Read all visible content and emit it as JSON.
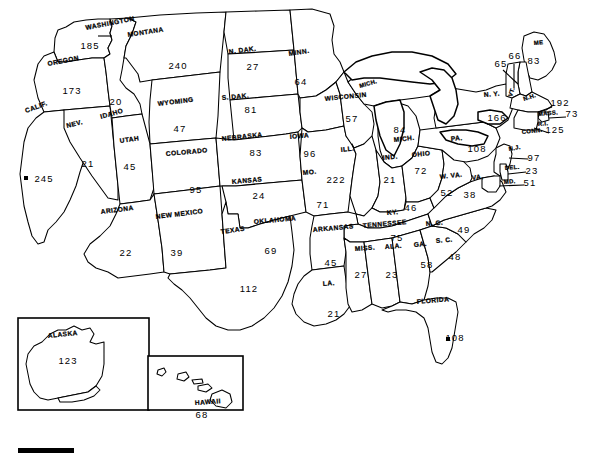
{
  "map": {
    "title": "United States map with per-state values",
    "projection_note": "Lower 48 with Alaska and Hawaii insets",
    "line_color": "#000000",
    "background_color": "#ffffff",
    "scale_bar": {
      "name": "scale-bar",
      "label": ""
    }
  },
  "states": [
    {
      "code": "WA",
      "name": "WASHINGTON",
      "value": "185",
      "nx": 86,
      "ny": 30,
      "rot": -11,
      "vx": 90,
      "vy": 49,
      "size": "normal"
    },
    {
      "code": "OR",
      "name": "OREGON",
      "value": "173",
      "nx": 48,
      "ny": 66,
      "rot": -11,
      "vx": 72,
      "vy": 94,
      "size": "normal"
    },
    {
      "code": "ID",
      "name": "IDAHO",
      "value": "20",
      "nx": 101,
      "ny": 119,
      "rot": -16,
      "vx": 116,
      "vy": 105,
      "size": "normal"
    },
    {
      "code": "MT",
      "name": "MONTANA",
      "value": "240",
      "nx": 128,
      "ny": 37,
      "rot": -9,
      "vx": 178,
      "vy": 69,
      "size": "normal"
    },
    {
      "code": "WY",
      "name": "WYOMING",
      "value": "47",
      "nx": 158,
      "ny": 106,
      "rot": -7,
      "vx": 180,
      "vy": 132,
      "size": "normal"
    },
    {
      "code": "ND",
      "name": "N. DAK.",
      "value": "27",
      "nx": 229,
      "ny": 54,
      "rot": -7,
      "vx": 253,
      "vy": 70,
      "size": "normal"
    },
    {
      "code": "SD",
      "name": "S. DAK.",
      "value": "81",
      "nx": 222,
      "ny": 100,
      "rot": -5,
      "vx": 251,
      "vy": 113,
      "size": "normal"
    },
    {
      "code": "MN",
      "name": "MINN.",
      "value": "64",
      "nx": 289,
      "ny": 56,
      "rot": -9,
      "vx": 301,
      "vy": 85,
      "size": "normal"
    },
    {
      "code": "NE",
      "name": "NEBRASKA",
      "value": "83",
      "nx": 222,
      "ny": 141,
      "rot": -6,
      "vx": 256,
      "vy": 156,
      "size": "normal"
    },
    {
      "code": "IA",
      "name": "IOWA",
      "value": "96",
      "nx": 290,
      "ny": 139,
      "rot": -5,
      "vx": 310,
      "vy": 157,
      "size": "normal"
    },
    {
      "code": "WI",
      "name": "WISCONSIN",
      "value": "57",
      "nx": 325,
      "ny": 101,
      "rot": -6,
      "vx": 352,
      "vy": 122,
      "size": "normal"
    },
    {
      "code": "MI",
      "name": "MICH.",
      "value": "84",
      "nx": 394,
      "ny": 142,
      "rot": -6,
      "vx": 400,
      "vy": 133,
      "size": "normal"
    },
    {
      "code": "MIU",
      "name": "MICH.",
      "value": "",
      "nx": 360,
      "ny": 88,
      "rot": -16,
      "vx": 0,
      "vy": 0,
      "size": "tiny"
    },
    {
      "code": "IL",
      "name": "ILL.",
      "value": "222",
      "nx": 341,
      "ny": 152,
      "rot": -6,
      "vx": 336,
      "vy": 183,
      "size": "normal"
    },
    {
      "code": "IN",
      "name": "IND.",
      "value": "21",
      "nx": 383,
      "ny": 160,
      "rot": -6,
      "vx": 390,
      "vy": 183,
      "size": "normal"
    },
    {
      "code": "OH",
      "name": "OHIO",
      "value": "72",
      "nx": 412,
      "ny": 157,
      "rot": -5,
      "vx": 421,
      "vy": 174,
      "size": "normal"
    },
    {
      "code": "MO",
      "name": "MO.",
      "value": "71",
      "nx": 303,
      "ny": 175,
      "rot": -6,
      "vx": 323,
      "vy": 208,
      "size": "normal"
    },
    {
      "code": "KS",
      "name": "KANSAS",
      "value": "24",
      "nx": 232,
      "ny": 184,
      "rot": -5,
      "vx": 259,
      "vy": 199,
      "size": "normal"
    },
    {
      "code": "CO",
      "name": "COLORADO",
      "value": "95",
      "nx": 166,
      "ny": 156,
      "rot": -5,
      "vx": 196,
      "vy": 193,
      "size": "normal"
    },
    {
      "code": "UT",
      "name": "UTAH",
      "value": "45",
      "nx": 120,
      "ny": 143,
      "rot": -8,
      "vx": 130,
      "vy": 170,
      "size": "normal"
    },
    {
      "code": "NV",
      "name": "NEV.",
      "value": "21",
      "nx": 67,
      "ny": 128,
      "rot": -14,
      "vx": 88,
      "vy": 167,
      "size": "normal"
    },
    {
      "code": "CA",
      "name": "CALIF.",
      "value": "245",
      "nx": 26,
      "ny": 113,
      "rot": -20,
      "vx": 44,
      "vy": 182,
      "size": "normal"
    },
    {
      "code": "AZ",
      "name": "ARIZONA",
      "value": "22",
      "nx": 101,
      "ny": 214,
      "rot": -7,
      "vx": 126,
      "vy": 256,
      "size": "normal"
    },
    {
      "code": "NM",
      "name": "NEW MEXICO",
      "value": "39",
      "nx": 156,
      "ny": 219,
      "rot": -7,
      "vx": 177,
      "vy": 256,
      "size": "normal"
    },
    {
      "code": "TX",
      "name": "TEXAS",
      "value": "112",
      "nx": 221,
      "ny": 234,
      "rot": -8,
      "vx": 249,
      "vy": 292,
      "size": "normal"
    },
    {
      "code": "OK",
      "name": "OKLAHOMA",
      "value": "69",
      "nx": 254,
      "ny": 224,
      "rot": -5,
      "vx": 271,
      "vy": 254,
      "size": "normal"
    },
    {
      "code": "AR",
      "name": "ARKANSAS",
      "value": "45",
      "nx": 313,
      "ny": 232,
      "rot": -5,
      "vx": 331,
      "vy": 266,
      "size": "normal"
    },
    {
      "code": "LA",
      "name": "LA.",
      "value": "21",
      "nx": 323,
      "ny": 286,
      "rot": -5,
      "vx": 334,
      "vy": 317,
      "size": "normal"
    },
    {
      "code": "MS",
      "name": "MISS.",
      "value": "27",
      "nx": 355,
      "ny": 251,
      "rot": -4,
      "vx": 361,
      "vy": 278,
      "size": "normal"
    },
    {
      "code": "AL",
      "name": "ALA.",
      "value": "23",
      "nx": 385,
      "ny": 249,
      "rot": -4,
      "vx": 392,
      "vy": 278,
      "size": "normal"
    },
    {
      "code": "TN",
      "name": "TENNESSEE",
      "value": "75",
      "nx": 363,
      "ny": 228,
      "rot": -5,
      "vx": 397,
      "vy": 241,
      "size": "normal"
    },
    {
      "code": "KY",
      "name": "KY.",
      "value": "46",
      "nx": 387,
      "ny": 215,
      "rot": -5,
      "vx": 411,
      "vy": 211,
      "size": "normal"
    },
    {
      "code": "GA",
      "name": "GA.",
      "value": "58",
      "nx": 414,
      "ny": 247,
      "rot": -5,
      "vx": 427,
      "vy": 268,
      "size": "normal"
    },
    {
      "code": "FL",
      "name": "FLORIDA",
      "value": "108",
      "nx": 417,
      "ny": 304,
      "rot": -5,
      "vx": 455,
      "vy": 341,
      "size": "normal"
    },
    {
      "code": "SC",
      "name": "S. C.",
      "value": "48",
      "nx": 436,
      "ny": 243,
      "rot": -5,
      "vx": 455,
      "vy": 260,
      "size": "normal"
    },
    {
      "code": "NC",
      "name": "N. C.",
      "value": "49",
      "nx": 426,
      "ny": 226,
      "rot": -5,
      "vx": 464,
      "vy": 233,
      "size": "normal"
    },
    {
      "code": "VA",
      "name": "VA.",
      "value": "38",
      "nx": 472,
      "ny": 180,
      "rot": -5,
      "vx": 470,
      "vy": 198,
      "size": "normal"
    },
    {
      "code": "WV",
      "name": "W. VA.",
      "value": "52",
      "nx": 440,
      "ny": 179,
      "rot": -6,
      "vx": 447,
      "vy": 196,
      "size": "normal"
    },
    {
      "code": "PA",
      "name": "PA.",
      "value": "108",
      "nx": 451,
      "ny": 141,
      "rot": -5,
      "vx": 477,
      "vy": 152,
      "size": "normal"
    },
    {
      "code": "NY",
      "name": "N. Y.",
      "value": "166",
      "nx": 484,
      "ny": 97,
      "rot": -5,
      "vx": 497,
      "vy": 121,
      "size": "normal"
    },
    {
      "code": "ME",
      "name": "ME",
      "value": "83",
      "nx": 534,
      "ny": 45,
      "rot": -5,
      "vx": 534,
      "vy": 64,
      "size": "tiny"
    },
    {
      "code": "VT",
      "name": "VT.",
      "value": "66",
      "nx": 512,
      "ny": 97,
      "rot": -72,
      "vx": 515,
      "vy": 59,
      "size": "tiny"
    },
    {
      "code": "NH",
      "name": "N.H.",
      "value": "65",
      "nx": 524,
      "ny": 101,
      "rot": -18,
      "vx": 501,
      "vy": 67,
      "size": "tiny"
    },
    {
      "code": "MA",
      "name": "MASS.",
      "value": "192",
      "nx": 538,
      "ny": 116,
      "rot": -5,
      "vx": 560,
      "vy": 106,
      "size": "tiny"
    },
    {
      "code": "RI",
      "name": "R.I.",
      "value": "73",
      "nx": 538,
      "ny": 126,
      "rot": -5,
      "vx": 572,
      "vy": 117,
      "size": "tiny"
    },
    {
      "code": "CT",
      "name": "CONN.",
      "value": "125",
      "nx": 522,
      "ny": 134,
      "rot": -6,
      "vx": 555,
      "vy": 133,
      "size": "tiny"
    },
    {
      "code": "NJ",
      "name": "N.J.",
      "value": "97",
      "nx": 509,
      "ny": 151,
      "rot": -10,
      "vx": 534,
      "vy": 161,
      "size": "tiny"
    },
    {
      "code": "DE",
      "name": "DEL.",
      "value": "23",
      "nx": 505,
      "ny": 170,
      "rot": -5,
      "vx": 532,
      "vy": 174,
      "size": "tiny"
    },
    {
      "code": "MD",
      "name": "MD.",
      "value": "51",
      "nx": 504,
      "ny": 184,
      "rot": -5,
      "vx": 530,
      "vy": 186,
      "size": "tiny"
    },
    {
      "code": "AK",
      "name": "ALASKA",
      "value": "123",
      "nx": 48,
      "ny": 338,
      "rot": -6,
      "vx": 68,
      "vy": 364,
      "size": "normal"
    },
    {
      "code": "HI",
      "name": "HAWAII",
      "value": "68",
      "nx": 195,
      "ny": 405,
      "rot": -4,
      "vx": 202,
      "vy": 418,
      "size": "normal"
    }
  ],
  "markers": [
    {
      "name": "city-dot-california",
      "x": 26,
      "y": 178
    },
    {
      "name": "city-dot-florida",
      "x": 448,
      "y": 339
    }
  ]
}
